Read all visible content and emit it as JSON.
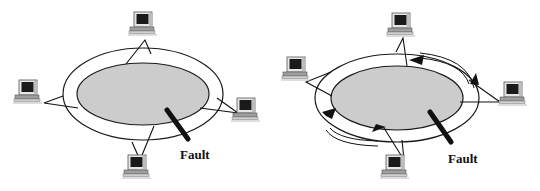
{
  "diagrams": [
    {
      "id": "left",
      "description": "Dual ring network with four workstations and a fault on the ring",
      "fault_label": "Fault",
      "workstations": 4
    },
    {
      "id": "right",
      "description": "Dual ring network with fault; traffic wraps around using the secondary ring (arrows)",
      "fault_label": "Fault",
      "workstations": 4
    }
  ],
  "colors": {
    "ring_fill": "#cccccc",
    "ring_stroke": "#1a1a1a",
    "background": "#ffffff",
    "fault_bar": "#111111"
  }
}
